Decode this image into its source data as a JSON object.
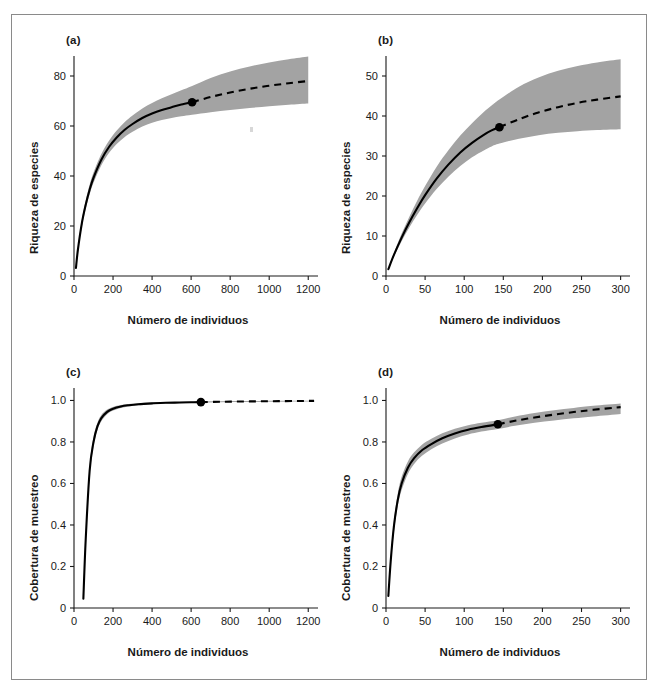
{
  "figure": {
    "background_color": "#ffffff",
    "frame_color": "#8a8a8a",
    "band_color": "#a3a3a3",
    "curve_color": "#000000"
  },
  "labels": {
    "panel_a": "(a)",
    "panel_b": "(b)",
    "panel_c": "(c)",
    "panel_d": "(d)",
    "xlabel": "Número de individuos",
    "ylabel_richness": "Riqueza de especies",
    "ylabel_coverage": "Cobertura de muestreo"
  },
  "chart_data": [
    {
      "id": "panel-a",
      "panel": "(a)",
      "type": "line",
      "title": "",
      "xlabel": "Número de individuos",
      "ylabel": "Riqueza de especies",
      "xlim": [
        0,
        1250
      ],
      "ylim": [
        0,
        88
      ],
      "xticks": [
        0,
        200,
        400,
        600,
        800,
        1000,
        1200
      ],
      "yticks": [
        0,
        20,
        40,
        60,
        80
      ],
      "grid": false,
      "legend": "none",
      "reference_point": {
        "x": 605,
        "y": 69.5,
        "label": "observed sample size"
      },
      "series": [
        {
          "name": "Interpolación (rarefacción)",
          "style": "solid",
          "x": [
            10,
            20,
            40,
            60,
            80,
            100,
            140,
            180,
            220,
            260,
            300,
            350,
            400,
            450,
            500,
            550,
            605
          ],
          "values": [
            3.2,
            10.5,
            21.0,
            28.5,
            34.5,
            39.3,
            46.5,
            51.7,
            55.5,
            58.5,
            60.8,
            63.2,
            65.0,
            66.4,
            67.5,
            68.6,
            69.5
          ]
        },
        {
          "name": "Extrapolación",
          "style": "dashed",
          "x": [
            605,
            700,
            800,
            900,
            1000,
            1100,
            1200
          ],
          "values": [
            69.5,
            71.6,
            73.4,
            74.9,
            76.1,
            77.1,
            78.0
          ]
        }
      ],
      "confidence_band": {
        "name": "IC 95%",
        "x": [
          10,
          20,
          40,
          60,
          80,
          100,
          140,
          180,
          220,
          260,
          300,
          350,
          400,
          450,
          500,
          550,
          605,
          700,
          800,
          900,
          1000,
          1100,
          1200
        ],
        "lower": [
          3.0,
          9.8,
          19.6,
          26.8,
          32.6,
          37.3,
          44.3,
          49.3,
          52.9,
          55.6,
          57.7,
          59.8,
          61.3,
          62.4,
          63.2,
          63.9,
          64.5,
          65.5,
          66.4,
          67.2,
          67.9,
          68.5,
          69.0
        ],
        "upper": [
          3.5,
          11.2,
          22.4,
          30.2,
          36.5,
          41.4,
          48.8,
          54.2,
          58.3,
          61.6,
          64.2,
          67.0,
          69.2,
          71.1,
          72.7,
          74.3,
          76.0,
          79.2,
          81.8,
          83.8,
          85.4,
          86.7,
          87.8
        ]
      }
    },
    {
      "id": "panel-b",
      "panel": "(b)",
      "type": "line",
      "title": "",
      "xlabel": "Número de individuos",
      "ylabel": "Riqueza de especies",
      "xlim": [
        0,
        312
      ],
      "ylim": [
        0,
        55
      ],
      "xticks": [
        0,
        50,
        100,
        150,
        200,
        250,
        300
      ],
      "yticks": [
        0,
        10,
        20,
        30,
        40,
        50
      ],
      "grid": false,
      "legend": "none",
      "reference_point": {
        "x": 145,
        "y": 37.2,
        "label": "observed sample size"
      },
      "series": [
        {
          "name": "Interpolación (rarefacción)",
          "style": "solid",
          "x": [
            3,
            10,
            20,
            30,
            40,
            50,
            65,
            80,
            95,
            110,
            125,
            135,
            145
          ],
          "values": [
            1.7,
            5.2,
            9.6,
            13.5,
            17.0,
            20.2,
            24.4,
            27.9,
            30.9,
            33.3,
            35.3,
            36.4,
            37.2
          ]
        },
        {
          "name": "Extrapolación",
          "style": "dashed",
          "x": [
            145,
            170,
            195,
            220,
            245,
            270,
            300
          ],
          "values": [
            37.2,
            39.2,
            40.9,
            42.2,
            43.3,
            44.1,
            44.9
          ]
        }
      ],
      "confidence_band": {
        "name": "IC 95%",
        "x": [
          3,
          10,
          20,
          30,
          40,
          50,
          65,
          80,
          95,
          110,
          125,
          135,
          145,
          170,
          195,
          220,
          245,
          270,
          300
        ],
        "lower": [
          1.6,
          4.8,
          8.7,
          12.2,
          15.3,
          18.1,
          21.8,
          24.9,
          27.5,
          29.7,
          31.4,
          32.4,
          33.1,
          34.3,
          35.2,
          35.8,
          36.2,
          36.5,
          36.7
        ],
        "upper": [
          1.9,
          5.7,
          10.6,
          14.9,
          18.9,
          22.5,
          27.4,
          31.5,
          35.1,
          38.2,
          41.0,
          42.6,
          44.1,
          47.3,
          49.6,
          51.3,
          52.5,
          53.4,
          54.2
        ]
      }
    },
    {
      "id": "panel-c",
      "panel": "(c)",
      "type": "line",
      "title": "",
      "xlabel": "Número de individuos",
      "ylabel": "Cobertura de muestreo",
      "xlim": [
        0,
        1250
      ],
      "ylim": [
        0,
        1.06
      ],
      "xticks": [
        0,
        200,
        400,
        600,
        800,
        1000,
        1200
      ],
      "yticks": [
        0,
        0.2,
        0.4,
        0.6,
        0.8,
        1.0
      ],
      "ytick_labels": [
        "0",
        "0.2",
        "0.4",
        "0.6",
        "0.8",
        "1.0"
      ],
      "grid": false,
      "legend": "none",
      "reference_point": {
        "x": 650,
        "y": 0.992,
        "label": "observed sample size"
      },
      "series": [
        {
          "name": "Interpolación (rarefacción)",
          "style": "solid",
          "x": [
            48,
            60,
            80,
            100,
            120,
            140,
            170,
            200,
            240,
            280,
            330,
            400,
            470,
            540,
            600,
            650
          ],
          "values": [
            0.045,
            0.33,
            0.66,
            0.8,
            0.875,
            0.915,
            0.945,
            0.96,
            0.971,
            0.977,
            0.982,
            0.986,
            0.989,
            0.99,
            0.991,
            0.992
          ]
        },
        {
          "name": "Extrapolación",
          "style": "dashed",
          "x": [
            650,
            750,
            850,
            950,
            1050,
            1150,
            1230
          ],
          "values": [
            0.992,
            0.9935,
            0.9948,
            0.9958,
            0.9967,
            0.9974,
            0.998
          ]
        }
      ],
      "confidence_band": {
        "name": "IC 95%",
        "x": [
          48,
          60,
          80,
          100,
          120,
          140,
          170,
          200,
          240,
          280,
          330,
          400,
          470,
          540,
          600,
          650,
          750,
          850,
          950,
          1050,
          1150,
          1230
        ],
        "lower": [
          0.04,
          0.31,
          0.635,
          0.778,
          0.858,
          0.9,
          0.934,
          0.951,
          0.964,
          0.971,
          0.977,
          0.982,
          0.985,
          0.987,
          0.988,
          0.989,
          0.991,
          0.992,
          0.993,
          0.994,
          0.995,
          0.9955
        ],
        "upper": [
          0.05,
          0.35,
          0.685,
          0.822,
          0.892,
          0.93,
          0.956,
          0.969,
          0.978,
          0.983,
          0.987,
          0.99,
          0.992,
          0.993,
          0.994,
          0.995,
          0.996,
          0.997,
          0.9975,
          0.998,
          0.9985,
          0.999
        ]
      }
    },
    {
      "id": "panel-d",
      "panel": "(d)",
      "type": "line",
      "title": "",
      "xlabel": "Número de individuos",
      "ylabel": "Cobertura de muestreo",
      "xlim": [
        0,
        312
      ],
      "ylim": [
        0,
        1.06
      ],
      "xticks": [
        0,
        50,
        100,
        150,
        200,
        250,
        300
      ],
      "yticks": [
        0,
        0.2,
        0.4,
        0.6,
        0.8,
        1.0
      ],
      "ytick_labels": [
        "0",
        "0.2",
        "0.4",
        "0.6",
        "0.8",
        "1.0"
      ],
      "grid": false,
      "legend": "none",
      "reference_point": {
        "x": 143,
        "y": 0.885,
        "label": "observed sample size"
      },
      "series": [
        {
          "name": "Interpolación (rarefacción)",
          "style": "solid",
          "x": [
            3,
            6,
            10,
            15,
            20,
            28,
            36,
            46,
            58,
            72,
            88,
            105,
            122,
            143
          ],
          "values": [
            0.058,
            0.225,
            0.39,
            0.52,
            0.6,
            0.676,
            0.722,
            0.76,
            0.79,
            0.818,
            0.841,
            0.859,
            0.872,
            0.885
          ]
        },
        {
          "name": "Extrapolación",
          "style": "dashed",
          "x": [
            143,
            165,
            190,
            215,
            240,
            265,
            300
          ],
          "values": [
            0.885,
            0.902,
            0.918,
            0.932,
            0.944,
            0.955,
            0.968
          ]
        }
      ],
      "confidence_band": {
        "name": "IC 95%",
        "x": [
          3,
          6,
          10,
          15,
          20,
          28,
          36,
          46,
          58,
          72,
          88,
          105,
          122,
          143,
          165,
          190,
          215,
          240,
          265,
          300
        ],
        "lower": [
          0.05,
          0.205,
          0.362,
          0.489,
          0.568,
          0.646,
          0.694,
          0.733,
          0.765,
          0.793,
          0.817,
          0.836,
          0.85,
          0.863,
          0.878,
          0.892,
          0.903,
          0.914,
          0.923,
          0.935
        ],
        "upper": [
          0.066,
          0.246,
          0.418,
          0.551,
          0.632,
          0.706,
          0.75,
          0.787,
          0.815,
          0.842,
          0.864,
          0.881,
          0.893,
          0.905,
          0.923,
          0.94,
          0.953,
          0.964,
          0.974,
          0.985
        ]
      }
    }
  ]
}
